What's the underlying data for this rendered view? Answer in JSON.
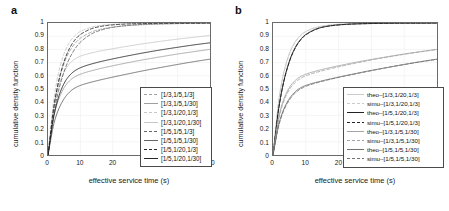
{
  "figure": {
    "panels": [
      {
        "label": "a",
        "xlabel": "effective service time (s)",
        "ylabel": "cumulative density function",
        "xticks": [
          "0",
          "10",
          "20",
          "30",
          "40",
          "50"
        ],
        "yticks": [
          "0",
          "0.1",
          "0.2",
          "0.3",
          "0.4",
          "0.5",
          "0.6",
          "0.7",
          "0.8",
          "0.9",
          "1"
        ],
        "legend": [
          {
            "label": "[1/3,1/5,1/3]",
            "style": "dashed",
            "color": "#9a9a9a"
          },
          {
            "label": "[1/3,1/5,1/30]",
            "style": "solid",
            "color": "#9a9a9a"
          },
          {
            "label": "[1/3,1/20,1/3]",
            "style": "dashed",
            "color": "#c4c4c4"
          },
          {
            "label": "[1/3,1/20,1/30]",
            "style": "solid",
            "color": "#c4c4c4"
          },
          {
            "label": "[1/5,1/5,1/3]",
            "style": "dashed",
            "color": "#5e5e5e"
          },
          {
            "label": "[1/5,1/5,1/30]",
            "style": "solid",
            "color": "#5e5e5e"
          },
          {
            "label": "[1/5,1/20,1/3]",
            "style": "dashed",
            "color": "#1c1c1c"
          },
          {
            "label": "[1/5,1/20,1/30]",
            "style": "solid",
            "color": "#1c1c1c"
          }
        ]
      },
      {
        "label": "b",
        "xlabel": "effective service time (s)",
        "ylabel": "cumulative density function",
        "xticks": [
          "0",
          "10",
          "20",
          "30",
          "40",
          "50"
        ],
        "yticks": [
          "0",
          "0.1",
          "0.2",
          "0.3",
          "0.4",
          "0.5",
          "0.6",
          "0.7",
          "0.8",
          "0.9",
          "1"
        ],
        "legend": [
          {
            "label": "theo–[1/3,1/20,1/3]",
            "style": "solid",
            "color": "#c8c8c8"
          },
          {
            "label": "simu–[1/3,1/20,1/3]",
            "style": "dashed",
            "color": "#c8c8c8"
          },
          {
            "label": "theo–[1/5,1/20,1/3]",
            "style": "solid",
            "color": "#161616"
          },
          {
            "label": "simu–[1/5,1/20,1/3]",
            "style": "dashed",
            "color": "#161616"
          },
          {
            "label": "theo–[1/3,1/5,1/30]",
            "style": "solid",
            "color": "#9e9e9e"
          },
          {
            "label": "simu–[1/3,1/5,1/30]",
            "style": "dashed",
            "color": "#9e9e9e"
          },
          {
            "label": "theo–[1/5,1/5,1/30]",
            "style": "solid",
            "color": "#6b6b6b"
          },
          {
            "label": "simu–[1/5,1/5,1/30]",
            "style": "dashed",
            "color": "#6b6b6b"
          }
        ]
      }
    ]
  },
  "chart_data": [
    {
      "type": "line",
      "title": "a",
      "xlabel": "effective service time (s)",
      "ylabel": "cumulative density function",
      "xlim": [
        0,
        50
      ],
      "ylim": [
        0,
        1
      ],
      "xticks": [
        0,
        10,
        20,
        30,
        40,
        50
      ],
      "yticks": [
        0,
        0.1,
        0.2,
        0.3,
        0.4,
        0.5,
        0.6,
        0.7,
        0.8,
        0.9,
        1.0
      ],
      "grid": true,
      "legend_position": "lower-right",
      "x": [
        0,
        2,
        4,
        6,
        8,
        10,
        15,
        20,
        25,
        30,
        35,
        40,
        45,
        50
      ],
      "series": [
        {
          "name": "[1/3,1/5,1/3]",
          "style": "dashed",
          "color": "#9a9a9a",
          "values": [
            0,
            0.4,
            0.62,
            0.755,
            0.835,
            0.885,
            0.945,
            0.969,
            0.981,
            0.988,
            0.992,
            0.995,
            0.997,
            0.998
          ]
        },
        {
          "name": "[1/3,1/5,1/30]",
          "style": "solid",
          "color": "#9a9a9a",
          "values": [
            0,
            0.315,
            0.465,
            0.545,
            0.588,
            0.612,
            0.648,
            0.676,
            0.701,
            0.724,
            0.745,
            0.765,
            0.783,
            0.8
          ]
        },
        {
          "name": "[1/3,1/20,1/3]",
          "style": "dashed",
          "color": "#c4c4c4",
          "values": [
            0,
            0.455,
            0.695,
            0.826,
            0.897,
            0.936,
            0.977,
            0.99,
            0.995,
            0.997,
            0.998,
            0.999,
            0.999,
            1.0
          ]
        },
        {
          "name": "[1/3,1/20,1/30]",
          "style": "solid",
          "color": "#c4c4c4",
          "values": [
            0,
            0.385,
            0.575,
            0.672,
            0.722,
            0.749,
            0.782,
            0.805,
            0.826,
            0.845,
            0.862,
            0.878,
            0.892,
            0.905
          ]
        },
        {
          "name": "[1/5,1/5,1/3]",
          "style": "dashed",
          "color": "#5e5e5e",
          "values": [
            0,
            0.345,
            0.555,
            0.698,
            0.792,
            0.855,
            0.935,
            0.967,
            0.982,
            0.99,
            0.994,
            0.996,
            0.998,
            0.999
          ]
        },
        {
          "name": "[1/5,1/5,1/30]",
          "style": "solid",
          "color": "#5e5e5e",
          "values": [
            0,
            0.255,
            0.385,
            0.46,
            0.503,
            0.527,
            0.562,
            0.59,
            0.616,
            0.641,
            0.664,
            0.686,
            0.707,
            0.726
          ]
        },
        {
          "name": "[1/5,1/20,1/3]",
          "style": "dashed",
          "color": "#1c1c1c",
          "values": [
            0,
            0.395,
            0.63,
            0.775,
            0.862,
            0.913,
            0.968,
            0.986,
            0.993,
            0.996,
            0.998,
            0.999,
            0.999,
            1.0
          ]
        },
        {
          "name": "[1/5,1/20,1/30]",
          "style": "solid",
          "color": "#1c1c1c",
          "values": [
            0,
            0.32,
            0.49,
            0.583,
            0.633,
            0.661,
            0.7,
            0.728,
            0.753,
            0.776,
            0.797,
            0.816,
            0.834,
            0.85
          ]
        }
      ]
    },
    {
      "type": "line",
      "title": "b",
      "xlabel": "effective service time (s)",
      "ylabel": "cumulative density function",
      "xlim": [
        0,
        50
      ],
      "ylim": [
        0,
        1
      ],
      "xticks": [
        0,
        10,
        20,
        30,
        40,
        50
      ],
      "yticks": [
        0,
        0.1,
        0.2,
        0.3,
        0.4,
        0.5,
        0.6,
        0.7,
        0.8,
        0.9,
        1.0
      ],
      "grid": true,
      "legend_position": "lower-right",
      "x": [
        0,
        2,
        4,
        6,
        8,
        10,
        15,
        20,
        25,
        30,
        35,
        40,
        45,
        50
      ],
      "series": [
        {
          "name": "theo-[1/3,1/20,1/3]",
          "style": "solid",
          "color": "#c8c8c8",
          "values": [
            0,
            0.455,
            0.695,
            0.826,
            0.897,
            0.936,
            0.977,
            0.99,
            0.995,
            0.997,
            0.998,
            0.999,
            0.999,
            1.0
          ]
        },
        {
          "name": "simu-[1/3,1/20,1/3]",
          "style": "dashed",
          "color": "#c8c8c8",
          "values": [
            0,
            0.45,
            0.69,
            0.822,
            0.894,
            0.934,
            0.976,
            0.99,
            0.995,
            0.997,
            0.998,
            0.999,
            0.999,
            1.0
          ]
        },
        {
          "name": "theo-[1/5,1/20,1/3]",
          "style": "solid",
          "color": "#161616",
          "values": [
            0,
            0.395,
            0.63,
            0.775,
            0.862,
            0.913,
            0.968,
            0.986,
            0.993,
            0.996,
            0.998,
            0.999,
            0.999,
            1.0
          ]
        },
        {
          "name": "simu-[1/5,1/20,1/3]",
          "style": "dashed",
          "color": "#161616",
          "values": [
            0,
            0.39,
            0.625,
            0.77,
            0.858,
            0.91,
            0.967,
            0.985,
            0.993,
            0.996,
            0.998,
            0.999,
            0.999,
            1.0
          ]
        },
        {
          "name": "theo-[1/3,1/5,1/30]",
          "style": "solid",
          "color": "#9e9e9e",
          "values": [
            0,
            0.315,
            0.465,
            0.545,
            0.588,
            0.612,
            0.648,
            0.676,
            0.701,
            0.724,
            0.745,
            0.765,
            0.783,
            0.8
          ]
        },
        {
          "name": "simu-[1/3,1/5,1/30]",
          "style": "dashed",
          "color": "#9e9e9e",
          "values": [
            0,
            0.3,
            0.45,
            0.53,
            0.574,
            0.6,
            0.638,
            0.668,
            0.695,
            0.72,
            0.742,
            0.763,
            0.782,
            0.8
          ]
        },
        {
          "name": "theo-[1/5,1/5,1/30]",
          "style": "solid",
          "color": "#6b6b6b",
          "values": [
            0,
            0.255,
            0.385,
            0.46,
            0.503,
            0.527,
            0.562,
            0.59,
            0.616,
            0.641,
            0.664,
            0.686,
            0.707,
            0.726
          ]
        },
        {
          "name": "simu-[1/5,1/5,1/30]",
          "style": "dashed",
          "color": "#6b6b6b",
          "values": [
            0,
            0.245,
            0.375,
            0.45,
            0.494,
            0.52,
            0.558,
            0.588,
            0.614,
            0.639,
            0.663,
            0.685,
            0.706,
            0.725
          ]
        }
      ]
    }
  ]
}
